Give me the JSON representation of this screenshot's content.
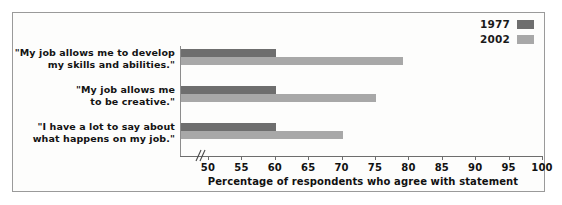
{
  "chart_data": {
    "type": "bar",
    "orientation": "horizontal",
    "title": "",
    "subtitle": "",
    "xlabel": "Percentage of respondents who agree with statement",
    "ylabel": "",
    "xlim": [
      50,
      100
    ],
    "xticks": [
      50,
      55,
      60,
      65,
      70,
      75,
      80,
      85,
      90,
      95,
      100
    ],
    "xtick_labels": [
      "50",
      "55",
      "60",
      "65",
      "70",
      "75",
      "80",
      "85",
      "90",
      "95",
      "100"
    ],
    "axis_break": true,
    "axis_break_symbol": "//",
    "grid": false,
    "legend_position": "top-right",
    "categories": [
      "\"My job allows me to develop\nmy skills and abilities.\"",
      "\"My job allows me\nto be creative.\"",
      "\"I have a lot to say about\nwhat happens on my job.\""
    ],
    "category_lines": [
      [
        "\"My job allows me to develop",
        "my skills and abilities.\""
      ],
      [
        "\"My job allows me",
        "to be creative.\""
      ],
      [
        "\"I have a lot to say about",
        "what happens on my job.\""
      ]
    ],
    "series": [
      {
        "name": "1977",
        "color": "#6e6e6e",
        "values": [
          60,
          60,
          60
        ]
      },
      {
        "name": "2002",
        "color": "#a8a8a8",
        "values": [
          79,
          75,
          70
        ]
      }
    ]
  },
  "legend": {
    "items": [
      {
        "label": "1977",
        "color": "#6e6e6e"
      },
      {
        "label": "2002",
        "color": "#a8a8a8"
      }
    ]
  },
  "colors": {
    "frame_border": "#9a9a9a",
    "background": "#fdfdfc",
    "axis": "#6d6d6d",
    "text": "#111111",
    "series_1977": "#6e6e6e",
    "series_2002": "#a8a8a8"
  }
}
